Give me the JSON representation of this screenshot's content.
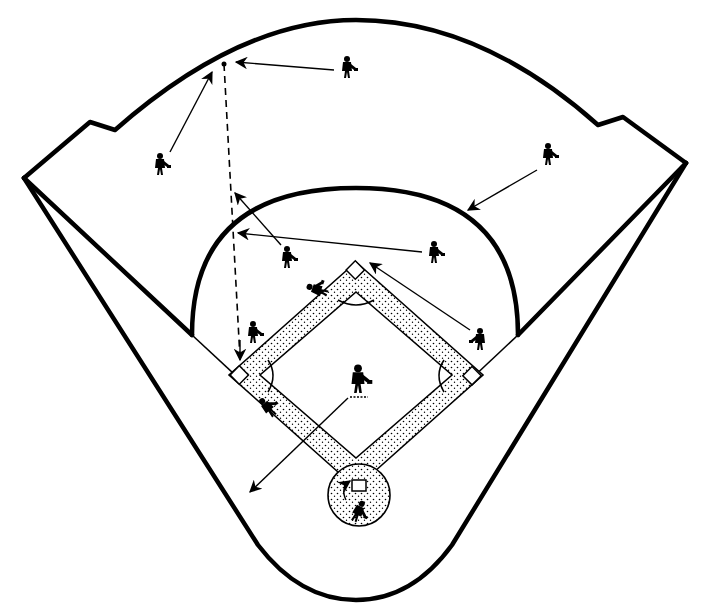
{
  "diagram": {
    "colors": {
      "ink": "#000000",
      "background": "#ffffff",
      "dirt_stipple": "#000000"
    },
    "elements": {
      "outfield_wall": "outfield fence with notched corners",
      "foul_lines": "left and right foul lines extending to foul poles",
      "infield_arc": "infield grass edge arc",
      "diamond": "base paths with stippled dirt",
      "home_plate_circle": "stippled home plate circle"
    },
    "bases": [
      "home plate",
      "first base",
      "second base",
      "third base"
    ],
    "players": [
      {
        "position": "left fielder",
        "x": 160,
        "y": 165
      },
      {
        "position": "center fielder",
        "x": 347,
        "y": 68
      },
      {
        "position": "right fielder",
        "x": 548,
        "y": 155
      },
      {
        "position": "shortstop",
        "x": 287,
        "y": 258
      },
      {
        "position": "second baseman",
        "x": 434,
        "y": 253
      },
      {
        "position": "third baseman",
        "x": 253,
        "y": 340
      },
      {
        "position": "first baseman",
        "x": 480,
        "y": 340
      },
      {
        "position": "pitcher",
        "x": 358,
        "y": 383
      },
      {
        "position": "catcher",
        "x": 358,
        "y": 512
      },
      {
        "position": "runner near third",
        "x": 268,
        "y": 408
      },
      {
        "position": "runner sliding to second",
        "x": 318,
        "y": 290
      }
    ],
    "arrows": [
      {
        "from": "left fielder",
        "to": "fly ball landing point"
      },
      {
        "from": "center fielder",
        "to": "fly ball landing point"
      },
      {
        "from": "right fielder",
        "to": "right-center gap"
      },
      {
        "from": "shortstop",
        "to": "shallow left"
      },
      {
        "from": "second baseman",
        "to": "infield edge left"
      },
      {
        "from": "first baseman",
        "to": "second base"
      },
      {
        "from": "pitcher",
        "to": "foul territory behind third"
      }
    ],
    "ball_path": "dashed line from third base area up to deep left-center fly ball"
  }
}
